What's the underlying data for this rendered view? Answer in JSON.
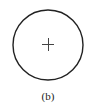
{
  "figure": {
    "caption": "(b)",
    "circle": {
      "cx": 48,
      "cy": 45,
      "r": 35,
      "stroke": "#222222"
    },
    "center_mark": {
      "type": "plus",
      "x": 48,
      "y": 44,
      "size": 6,
      "stroke": "#444444"
    }
  }
}
